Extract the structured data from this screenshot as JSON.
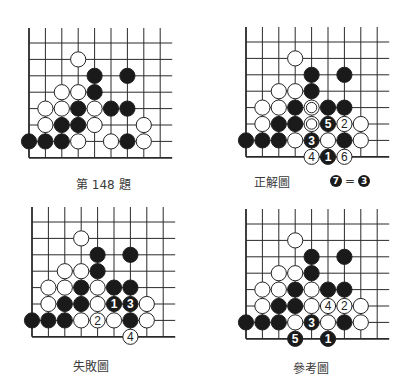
{
  "page": {
    "colors": {
      "black_stone": "#1a1a1a",
      "white_stone": "#ffffff",
      "line": "#2a2a2a",
      "text": "#3a3a3a"
    }
  },
  "diagrams": [
    {
      "id": "problem",
      "caption": "第 148 題",
      "origin": [
        29,
        43
      ],
      "spacing": 16.4,
      "cols": 9,
      "rows": 8,
      "stones": [
        {
          "c": 3,
          "r": 1,
          "color": "W"
        },
        {
          "c": 4,
          "r": 2,
          "color": "B"
        },
        {
          "c": 6,
          "r": 2,
          "color": "B"
        },
        {
          "c": 2,
          "r": 3,
          "color": "W"
        },
        {
          "c": 3,
          "r": 3,
          "color": "W"
        },
        {
          "c": 4,
          "r": 3,
          "color": "B"
        },
        {
          "c": 1,
          "r": 4,
          "color": "W"
        },
        {
          "c": 2,
          "r": 4,
          "color": "W"
        },
        {
          "c": 3,
          "r": 4,
          "color": "B"
        },
        {
          "c": 4,
          "r": 4,
          "color": "W"
        },
        {
          "c": 5,
          "r": 4,
          "color": "B"
        },
        {
          "c": 6,
          "r": 4,
          "color": "B"
        },
        {
          "c": 1,
          "r": 5,
          "color": "W"
        },
        {
          "c": 2,
          "r": 5,
          "color": "B"
        },
        {
          "c": 3,
          "r": 5,
          "color": "B"
        },
        {
          "c": 4,
          "r": 5,
          "color": "W"
        },
        {
          "c": 7,
          "r": 5,
          "color": "W"
        },
        {
          "c": 0,
          "r": 6,
          "color": "B"
        },
        {
          "c": 1,
          "r": 6,
          "color": "B"
        },
        {
          "c": 2,
          "r": 6,
          "color": "B"
        },
        {
          "c": 3,
          "r": 6,
          "color": "W"
        },
        {
          "c": 5,
          "r": 6,
          "color": "W"
        },
        {
          "c": 6,
          "r": 6,
          "color": "B"
        },
        {
          "c": 7,
          "r": 6,
          "color": "W"
        }
      ]
    },
    {
      "id": "correct",
      "caption": "正解圖",
      "note": {
        "left": "7",
        "sign": "=",
        "right": "3"
      },
      "origin": [
        246,
        42
      ],
      "spacing": 16.4,
      "cols": 9,
      "rows": 8,
      "stones": [
        {
          "c": 3,
          "r": 1,
          "color": "W"
        },
        {
          "c": 4,
          "r": 2,
          "color": "B"
        },
        {
          "c": 6,
          "r": 2,
          "color": "B"
        },
        {
          "c": 2,
          "r": 3,
          "color": "W"
        },
        {
          "c": 3,
          "r": 3,
          "color": "W"
        },
        {
          "c": 4,
          "r": 3,
          "color": "B"
        },
        {
          "c": 1,
          "r": 4,
          "color": "W"
        },
        {
          "c": 2,
          "r": 4,
          "color": "W"
        },
        {
          "c": 3,
          "r": 4,
          "color": "B"
        },
        {
          "c": 4,
          "r": 4,
          "color": "W",
          "mark": "double"
        },
        {
          "c": 5,
          "r": 4,
          "color": "B"
        },
        {
          "c": 6,
          "r": 4,
          "color": "B"
        },
        {
          "c": 1,
          "r": 5,
          "color": "W"
        },
        {
          "c": 2,
          "r": 5,
          "color": "B"
        },
        {
          "c": 3,
          "r": 5,
          "color": "B"
        },
        {
          "c": 4,
          "r": 5,
          "color": "W",
          "mark": "double"
        },
        {
          "c": 5,
          "r": 5,
          "color": "B",
          "num": "5"
        },
        {
          "c": 6,
          "r": 5,
          "color": "W",
          "num": "2"
        },
        {
          "c": 7,
          "r": 5,
          "color": "W"
        },
        {
          "c": 0,
          "r": 6,
          "color": "B"
        },
        {
          "c": 1,
          "r": 6,
          "color": "B"
        },
        {
          "c": 2,
          "r": 6,
          "color": "B"
        },
        {
          "c": 3,
          "r": 6,
          "color": "W"
        },
        {
          "c": 4,
          "r": 6,
          "color": "B",
          "num": "3"
        },
        {
          "c": 5,
          "r": 6,
          "color": "W"
        },
        {
          "c": 6,
          "r": 6,
          "color": "B"
        },
        {
          "c": 7,
          "r": 6,
          "color": "W"
        },
        {
          "c": 4,
          "r": 7,
          "color": "W",
          "num": "4"
        },
        {
          "c": 5,
          "r": 7,
          "color": "B",
          "num": "1"
        },
        {
          "c": 6,
          "r": 7,
          "color": "W",
          "num": "6"
        }
      ]
    },
    {
      "id": "failure",
      "caption": "失敗圖",
      "origin": [
        32,
        222
      ],
      "spacing": 16.4,
      "cols": 9,
      "rows": 8,
      "stones": [
        {
          "c": 3,
          "r": 1,
          "color": "W"
        },
        {
          "c": 4,
          "r": 2,
          "color": "B"
        },
        {
          "c": 6,
          "r": 2,
          "color": "B"
        },
        {
          "c": 2,
          "r": 3,
          "color": "W"
        },
        {
          "c": 3,
          "r": 3,
          "color": "W"
        },
        {
          "c": 4,
          "r": 3,
          "color": "B"
        },
        {
          "c": 1,
          "r": 4,
          "color": "W"
        },
        {
          "c": 2,
          "r": 4,
          "color": "W"
        },
        {
          "c": 3,
          "r": 4,
          "color": "B"
        },
        {
          "c": 4,
          "r": 4,
          "color": "W"
        },
        {
          "c": 5,
          "r": 4,
          "color": "B"
        },
        {
          "c": 6,
          "r": 4,
          "color": "B"
        },
        {
          "c": 1,
          "r": 5,
          "color": "W"
        },
        {
          "c": 2,
          "r": 5,
          "color": "B"
        },
        {
          "c": 3,
          "r": 5,
          "color": "B"
        },
        {
          "c": 4,
          "r": 5,
          "color": "W"
        },
        {
          "c": 5,
          "r": 5,
          "color": "B",
          "num": "1"
        },
        {
          "c": 6,
          "r": 5,
          "color": "B",
          "num": "3"
        },
        {
          "c": 7,
          "r": 5,
          "color": "W"
        },
        {
          "c": 0,
          "r": 6,
          "color": "B"
        },
        {
          "c": 1,
          "r": 6,
          "color": "B"
        },
        {
          "c": 2,
          "r": 6,
          "color": "B"
        },
        {
          "c": 3,
          "r": 6,
          "color": "W"
        },
        {
          "c": 4,
          "r": 6,
          "color": "W",
          "num": "2"
        },
        {
          "c": 5,
          "r": 6,
          "color": "W"
        },
        {
          "c": 6,
          "r": 6,
          "color": "B"
        },
        {
          "c": 7,
          "r": 6,
          "color": "W"
        },
        {
          "c": 6,
          "r": 7,
          "color": "W",
          "num": "4"
        }
      ]
    },
    {
      "id": "reference",
      "caption": "參考圖",
      "origin": [
        246,
        224
      ],
      "spacing": 16.4,
      "cols": 9,
      "rows": 8,
      "stones": [
        {
          "c": 3,
          "r": 1,
          "color": "W"
        },
        {
          "c": 4,
          "r": 2,
          "color": "B"
        },
        {
          "c": 6,
          "r": 2,
          "color": "B"
        },
        {
          "c": 2,
          "r": 3,
          "color": "W"
        },
        {
          "c": 3,
          "r": 3,
          "color": "W"
        },
        {
          "c": 4,
          "r": 3,
          "color": "B"
        },
        {
          "c": 1,
          "r": 4,
          "color": "W"
        },
        {
          "c": 2,
          "r": 4,
          "color": "W"
        },
        {
          "c": 3,
          "r": 4,
          "color": "B"
        },
        {
          "c": 4,
          "r": 4,
          "color": "W"
        },
        {
          "c": 5,
          "r": 4,
          "color": "B"
        },
        {
          "c": 6,
          "r": 4,
          "color": "B"
        },
        {
          "c": 1,
          "r": 5,
          "color": "W"
        },
        {
          "c": 2,
          "r": 5,
          "color": "B"
        },
        {
          "c": 3,
          "r": 5,
          "color": "B"
        },
        {
          "c": 4,
          "r": 5,
          "color": "W"
        },
        {
          "c": 5,
          "r": 5,
          "color": "W",
          "num": "4"
        },
        {
          "c": 6,
          "r": 5,
          "color": "W",
          "num": "2"
        },
        {
          "c": 7,
          "r": 5,
          "color": "W"
        },
        {
          "c": 0,
          "r": 6,
          "color": "B"
        },
        {
          "c": 1,
          "r": 6,
          "color": "B"
        },
        {
          "c": 2,
          "r": 6,
          "color": "B"
        },
        {
          "c": 3,
          "r": 6,
          "color": "W"
        },
        {
          "c": 4,
          "r": 6,
          "color": "B",
          "num": "3"
        },
        {
          "c": 5,
          "r": 6,
          "color": "W"
        },
        {
          "c": 6,
          "r": 6,
          "color": "B"
        },
        {
          "c": 7,
          "r": 6,
          "color": "W"
        },
        {
          "c": 3,
          "r": 7,
          "color": "B",
          "num": "5"
        },
        {
          "c": 5,
          "r": 7,
          "color": "B",
          "num": "1"
        }
      ]
    }
  ]
}
